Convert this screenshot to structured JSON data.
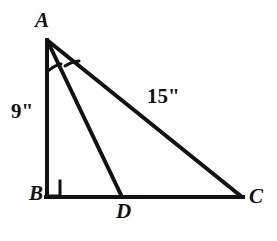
{
  "figure": {
    "type": "right-triangle-with-cevian",
    "background_color": "#ffffff",
    "stroke_color": "#121212",
    "vertices": {
      "A": {
        "label": "A",
        "x": 47,
        "y": 40
      },
      "B": {
        "label": "B",
        "x": 47,
        "y": 197
      },
      "C": {
        "label": "C",
        "x": 242,
        "y": 197
      },
      "D": {
        "label": "D",
        "x": 122,
        "y": 197
      }
    },
    "segments": [
      {
        "name": "AB",
        "from": "A",
        "to": "B",
        "measure_label": "9\""
      },
      {
        "name": "BC",
        "from": "B",
        "to": "C",
        "measure_label": ""
      },
      {
        "name": "AC",
        "from": "A",
        "to": "C",
        "measure_label": "15\""
      },
      {
        "name": "AD",
        "from": "A",
        "to": "D",
        "measure_label": ""
      }
    ],
    "measures": {
      "leg_ab": "9\"",
      "hypotenuse_ac": "15\""
    },
    "marks": {
      "right_angle_at": "B",
      "right_angle_symbol": "right-angle-square",
      "congruent_angle_arcs_at": "A",
      "arc_count": 2
    }
  }
}
